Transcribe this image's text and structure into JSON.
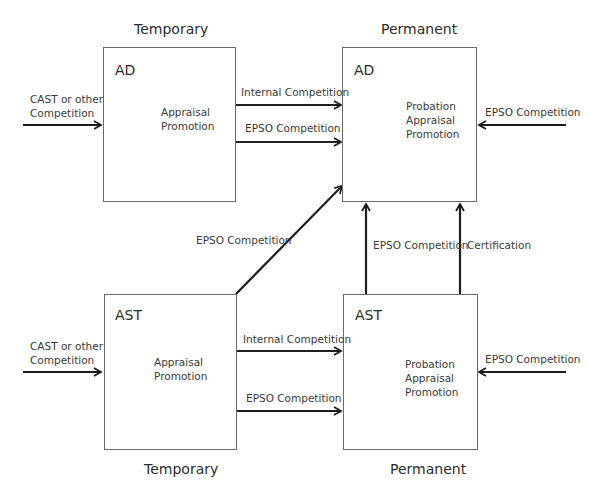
{
  "diagram": {
    "columns": {
      "temporary_top": "Temporary",
      "permanent_top": "Permanent",
      "temporary_bottom": "Temporary",
      "permanent_bottom": "Permanent"
    },
    "boxes": {
      "ad_temporary": {
        "title": "AD",
        "lines": [
          "Appraisal",
          "Promotion"
        ]
      },
      "ad_permanent": {
        "title": "AD",
        "lines": [
          "Probation",
          "Appraisal",
          "Promotion"
        ]
      },
      "ast_temporary": {
        "title": "AST",
        "lines": [
          "Appraisal",
          "Promotion"
        ]
      },
      "ast_permanent": {
        "title": "AST",
        "lines": [
          "Probation",
          "Appraisal",
          "Promotion"
        ]
      }
    },
    "edges": {
      "cast_to_ad_temp": [
        "CAST or other",
        "Competition"
      ],
      "cast_to_ast_temp": [
        "CAST or other",
        "Competition"
      ],
      "ad_temp_to_ad_perm_internal": "Internal Competition",
      "ad_temp_to_ad_perm_epso": "EPSO Competition",
      "ast_temp_to_ast_perm_internal": "Internal Competition",
      "ast_temp_to_ast_perm_epso": "EPSO Competition",
      "ast_temp_to_ad_perm_epso": "EPSO Competition",
      "ast_perm_to_ad_perm_epso": "EPSO Competition",
      "ast_perm_to_ad_perm_cert": "Certification",
      "external_to_ad_perm": "EPSO Competition",
      "external_to_ast_perm": "EPSO Competition"
    },
    "colors": {
      "arrow": "#1e1e1e",
      "box_border": "#6a6a6a",
      "text": "#333333"
    }
  }
}
